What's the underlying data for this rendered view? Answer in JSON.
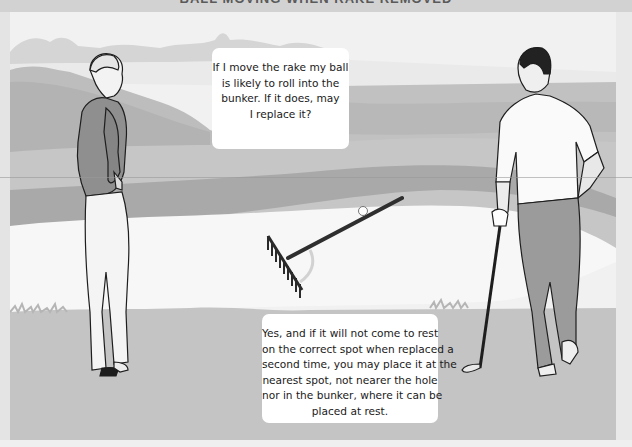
{
  "header": {
    "title": "BALL MOVING WHEN RAKE REMOVED"
  },
  "illustration": {
    "description": "Two golfers beside a bunker with a rake lying in it and a ball resting against the rake handle",
    "colors": {
      "sky": "#f1f1f1",
      "distant_trees": "#d4d4d4",
      "fairway": "#c3c3c3",
      "rough": "#b0b0b0",
      "bunker_sand": "#f7f7f7",
      "left_golfer_shirt": "#8f8f8f",
      "left_golfer_trousers": "#f4f4f4",
      "right_golfer_shirt": "#fafafa",
      "right_golfer_trousers": "#9b9b9b",
      "rake": "#3a3a3a",
      "outline": "#1e1e1e"
    }
  },
  "dialogue": {
    "question": {
      "speaker": "left golfer",
      "lines": [
        "If I move the rake my ball",
        "is likely to roll into the",
        "bunker. If it does, may",
        "I replace it?"
      ]
    },
    "answer": {
      "speaker": "right golfer",
      "lines": [
        "Yes, and if it will not come to rest",
        "on the correct spot when replaced a",
        "second time, you may place it at the",
        "nearest spot, not nearer the hole",
        "nor in the bunker, where it can be",
        "placed at rest."
      ]
    }
  }
}
